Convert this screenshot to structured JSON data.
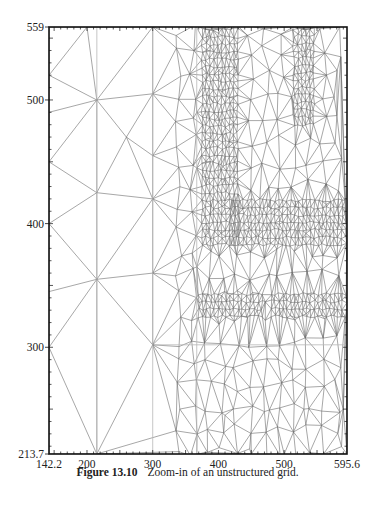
{
  "figure": {
    "caption_number": "Figure 13.10",
    "caption_text": "Zoom-in of an unstructured grid."
  },
  "chart_data": {
    "type": "mesh",
    "title": "",
    "xlabel": "",
    "ylabel": "",
    "xlim": [
      142.2,
      595.6
    ],
    "ylim": [
      213.7,
      559
    ],
    "x_tick_labels": [
      "142.2",
      "200",
      "300",
      "400",
      "500",
      "595.6"
    ],
    "x_tick_values": [
      142.2,
      200,
      300,
      400,
      500,
      595.6
    ],
    "y_tick_labels": [
      "559",
      "500",
      "400",
      "300",
      "213.7"
    ],
    "y_tick_values": [
      559,
      500,
      400,
      300,
      213.7
    ],
    "grid": false,
    "legend": "none",
    "reference_lines_x": [
      215,
      300,
      367
    ],
    "reference_lines_y": [
      302
    ],
    "refinement_regions": [
      {
        "name": "vertical-band",
        "x": [
          375,
          430
        ],
        "y": [
          383,
          559
        ]
      },
      {
        "name": "horizontal-band",
        "x": [
          420,
          595.6
        ],
        "y": [
          383,
          420
        ]
      },
      {
        "name": "upper-right-band",
        "x": [
          515,
          545
        ],
        "y": [
          480,
          559
        ]
      },
      {
        "name": "lower-band-1",
        "x": [
          370,
          470
        ],
        "y": [
          325,
          345
        ]
      },
      {
        "name": "lower-band-2",
        "x": [
          480,
          595.6
        ],
        "y": [
          325,
          345
        ]
      }
    ],
    "colors": {
      "mesh": "#6b6b6b",
      "reference_line": "#b8b8b8",
      "axis": "#111111"
    }
  }
}
